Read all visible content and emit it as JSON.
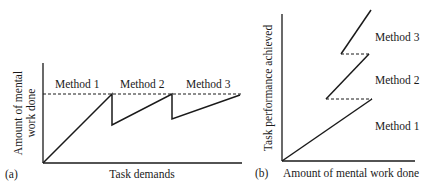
{
  "panel_a": {
    "tag": "(a)",
    "ylabel_line1": "Amount of mental",
    "ylabel_line2": "work done",
    "xlabel": "Task demands",
    "methods": [
      "Method 1",
      "Method 2",
      "Method 3"
    ]
  },
  "panel_b": {
    "tag": "(b)",
    "ylabel": "Task performance achieved",
    "xlabel": "Amount of mental work done",
    "methods": [
      "Method 1",
      "Method 2",
      "Method 3"
    ]
  },
  "colors": {
    "line": "#1a1a1a",
    "background": "#ffffff"
  }
}
